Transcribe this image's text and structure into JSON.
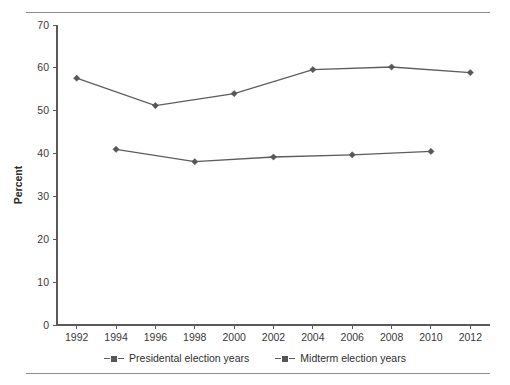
{
  "chart_data": {
    "type": "line",
    "title": "",
    "xlabel": "",
    "ylabel": "Percent",
    "xlim": [
      1991,
      2013
    ],
    "ylim": [
      0,
      70
    ],
    "grid": false,
    "legend_position": "bottom-center",
    "x_ticks": [
      "1992",
      "1994",
      "1996",
      "1998",
      "2000",
      "2002",
      "2004",
      "2006",
      "2008",
      "2010",
      "2012"
    ],
    "y_ticks": [
      "0",
      "10",
      "20",
      "30",
      "40",
      "50",
      "60",
      "70"
    ],
    "series": [
      {
        "name": "Presidental election years",
        "marker": "diamond",
        "color": "#575757",
        "x": [
          1992,
          1996,
          2000,
          2004,
          2008,
          2012
        ],
        "values": [
          57.6,
          51.2,
          54.0,
          59.6,
          60.2,
          58.9
        ]
      },
      {
        "name": "Midterm election years",
        "marker": "diamond",
        "color": "#575757",
        "x": [
          1994,
          1998,
          2002,
          2006,
          2010
        ],
        "values": [
          41.0,
          38.1,
          39.2,
          39.7,
          40.5
        ]
      }
    ]
  },
  "legend": {
    "entries": [
      {
        "label": "Presidental election years"
      },
      {
        "label": "Midterm election years"
      }
    ]
  }
}
